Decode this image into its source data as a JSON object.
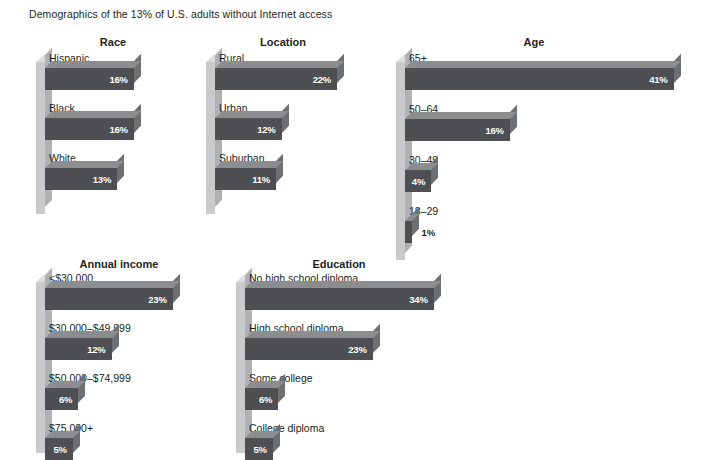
{
  "page": {
    "title": "Demographics of the 13% of U.S. adults without Internet access",
    "background_color": "#ffffff",
    "bar_color": "#4d4f53",
    "bar_top_color": "#8b8d8f",
    "bar_side_color": "#6d6f72",
    "axis_color": "#c9cacb",
    "value_label_color": "#ffffff",
    "text_color": "#231f20"
  },
  "chart_data": [
    {
      "type": "bar",
      "title": "Race",
      "orientation": "horizontal",
      "xlabel": "",
      "ylabel": "",
      "xlim": [
        0,
        45
      ],
      "grid": false,
      "legend": "none",
      "categories": [
        "Hispanic",
        "Black",
        "White"
      ],
      "values": [
        16,
        16,
        13
      ],
      "value_labels": [
        "16%",
        "16%",
        "13%"
      ]
    },
    {
      "type": "bar",
      "title": "Location",
      "orientation": "horizontal",
      "xlabel": "",
      "ylabel": "",
      "xlim": [
        0,
        45
      ],
      "grid": false,
      "legend": "none",
      "categories": [
        "Rural",
        "Urban",
        "Suburban"
      ],
      "values": [
        22,
        12,
        11
      ],
      "value_labels": [
        "22%",
        "12%",
        "11%"
      ]
    },
    {
      "type": "bar",
      "title": "Age",
      "orientation": "horizontal",
      "xlabel": "",
      "ylabel": "",
      "xlim": [
        0,
        45
      ],
      "grid": false,
      "legend": "none",
      "categories": [
        "65+",
        "50–64",
        "30–49",
        "18–29"
      ],
      "values": [
        41,
        16,
        4,
        1
      ],
      "value_labels": [
        "41%",
        "16%",
        "4%",
        "1%"
      ]
    },
    {
      "type": "bar",
      "title": "Annual income",
      "orientation": "horizontal",
      "xlabel": "",
      "ylabel": "",
      "xlim": [
        0,
        45
      ],
      "grid": false,
      "legend": "none",
      "categories": [
        "<$30,000",
        "$30,000–$49,999",
        "$50,000–$74,999",
        "$75,000+"
      ],
      "values": [
        23,
        12,
        6,
        5
      ],
      "value_labels": [
        "23%",
        "12%",
        "6%",
        "5%"
      ]
    },
    {
      "type": "bar",
      "title": "Education",
      "orientation": "horizontal",
      "xlabel": "",
      "ylabel": "",
      "xlim": [
        0,
        45
      ],
      "grid": false,
      "legend": "none",
      "categories": [
        "No high school diploma",
        "High school diploma",
        "Some college",
        "College diploma"
      ],
      "values": [
        34,
        23,
        6,
        5
      ],
      "value_labels": [
        "34%",
        "23%",
        "6%",
        "5%"
      ]
    }
  ]
}
